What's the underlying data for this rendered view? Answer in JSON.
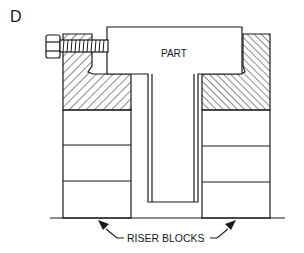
{
  "figure": {
    "panel_label": "D",
    "part_label": "PART",
    "callout_label": "RISER BLOCKS",
    "components": [
      {
        "name": "part",
        "shape": "inverted-T"
      },
      {
        "name": "clamp-block-left",
        "style": "hatched"
      },
      {
        "name": "clamp-block-right",
        "style": "hatched"
      },
      {
        "name": "clamp-bolt",
        "side": "left"
      },
      {
        "name": "riser-stack-left",
        "blocks": 3
      },
      {
        "name": "riser-stack-right",
        "blocks": 3
      },
      {
        "name": "base-surface"
      }
    ],
    "colors": {
      "line": "#1a1a1a",
      "background": "#ffffff"
    }
  }
}
